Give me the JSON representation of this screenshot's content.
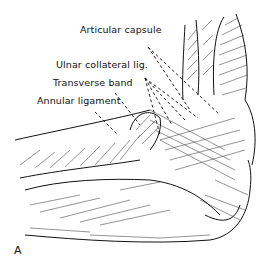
{
  "figure": {
    "panel_label": "A"
  },
  "labels": [
    {
      "text": "Articular capsule",
      "x": 80,
      "y": 31
    },
    {
      "text": "Ulnar collateral lig.",
      "x": 56,
      "y": 66
    },
    {
      "text": "Transverse band",
      "x": 53,
      "y": 83
    },
    {
      "text": "Annular ligament",
      "x": 37,
      "y": 101
    }
  ],
  "colors": {
    "ink": "#111111",
    "background": "#ffffff"
  }
}
